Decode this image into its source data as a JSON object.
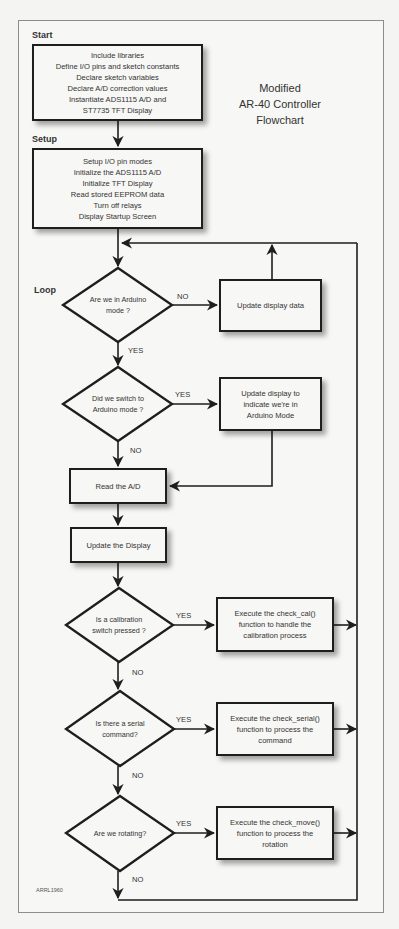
{
  "title": {
    "lines": [
      "Modified",
      "AR-40 Controller",
      "Flowchart"
    ]
  },
  "sections": {
    "start": "Start",
    "setup": "Setup",
    "loop": "Loop"
  },
  "boxes": {
    "start_box": [
      "Include libraries",
      "Define I/O pins and sketch constants",
      "Declare sketch variables",
      "Declare A/D correction values",
      "Instantiate ADS1115 A/D and",
      "ST7735 TFT Display"
    ],
    "setup_box": [
      "Setup I/O pin modes",
      "Initialize the ADS1115 A/D",
      "Initialize TFT Display",
      "Read stored EEPROM data",
      "Turn off relays",
      "Display Startup Screen"
    ],
    "update_display_data": [
      "Update display data"
    ],
    "update_display_arduino": [
      "Update display to",
      "indicate we're in",
      "Arduino Mode"
    ],
    "read_ad": [
      "Read the A/D"
    ],
    "update_the_display": [
      "Update the Display"
    ],
    "check_cal": [
      "Execute the check_cal()",
      "function to handle the",
      "calibration process"
    ],
    "check_serial": [
      "Execute the check_serial()",
      "function to process the",
      "command"
    ],
    "check_move": [
      "Execute the check_move()",
      "function to process the",
      "rotation"
    ]
  },
  "decisions": {
    "arduino_mode": [
      "Are we in Arduino",
      "mode ?"
    ],
    "switch_arduino": [
      "Did we switch to",
      "Arduino mode ?"
    ],
    "calibration": [
      "Is a calibration",
      "switch pressed ?"
    ],
    "serial": [
      "Is there a serial",
      "command?"
    ],
    "rotating": [
      "Are we rotating?"
    ]
  },
  "edge_labels": {
    "d1_no": "NO",
    "d1_yes": "YES",
    "d2_yes": "YES",
    "d2_no": "NO",
    "d3_yes": "YES",
    "d3_no": "NO",
    "d4_yes": "YES",
    "d4_no": "NO",
    "d5_yes": "YES",
    "d5_no": "NO"
  },
  "credit": "ARRL1960",
  "colors": {
    "line": "#1e1e1e",
    "frame": "#8d8d8d",
    "background": "#f4f4f2"
  }
}
